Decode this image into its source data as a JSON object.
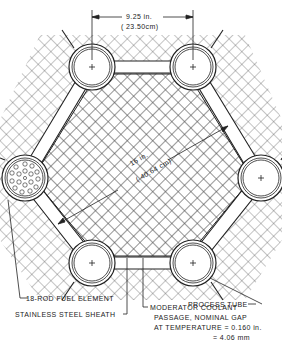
{
  "diagram": {
    "type": "reactor lattice cell cross-section",
    "dimensions": {
      "pitch": {
        "imperial": "9.25 in.",
        "metric": "( 23.50cm)"
      },
      "flat_to_flat": {
        "imperial": "16 in.",
        "metric": "( 40.64 cm)"
      }
    },
    "callouts": {
      "fuel_element": "18-ROD FUEL ELEMENT",
      "sheath": "STAINLESS STEEL SHEATH",
      "process_tube": "PROCESS TUBE",
      "coolant_line1": "MODERATOR COOLANT",
      "coolant_line2": "PASSAGE, NOMINAL GAP",
      "coolant_line3": "AT TEMPERATURE = 0.160 in.",
      "coolant_line4": "= 4.06 mm"
    },
    "tubes": [
      {
        "id": "top-left",
        "cx": 92,
        "cy": 67
      },
      {
        "id": "top-right",
        "cx": 193,
        "cy": 67
      },
      {
        "id": "left",
        "cx": 25,
        "cy": 178,
        "contains_fuel_element": true
      },
      {
        "id": "right",
        "cx": 261,
        "cy": 178
      },
      {
        "id": "bottom-left",
        "cx": 92,
        "cy": 263
      },
      {
        "id": "bottom-right",
        "cx": 193,
        "cy": 263
      }
    ],
    "colors": {
      "line": "#222222",
      "hatch": "#666666",
      "background": "#ffffff"
    }
  }
}
